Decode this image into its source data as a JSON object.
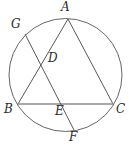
{
  "figure": {
    "width": 129,
    "height": 146,
    "background": "#ffffff",
    "stroke_color": "#595959",
    "chord_bc_color": "#8c8c8c",
    "stroke_width": 1
  },
  "circle": {
    "center_x": 65.5,
    "center_y": 75,
    "radius": 56.5
  },
  "points": {
    "A": {
      "label": "A",
      "x": 68,
      "y": 19,
      "label_x": 61,
      "label_y": 1
    },
    "B": {
      "label": "B",
      "x": 18,
      "y": 104,
      "label_x": 4,
      "label_y": 103
    },
    "C": {
      "label": "C",
      "x": 113,
      "y": 104,
      "label_x": 116,
      "label_y": 103
    },
    "D": {
      "label": "D",
      "x": 47,
      "y": 56,
      "label_x": 48,
      "label_y": 52
    },
    "E": {
      "label": "E",
      "x": 62,
      "y": 104,
      "label_x": 55,
      "label_y": 105
    },
    "F": {
      "label": "F",
      "x": 74,
      "y": 130,
      "label_x": 69,
      "label_y": 131
    },
    "G": {
      "label": "G",
      "x": 25,
      "y": 34,
      "label_x": 11,
      "label_y": 18
    }
  },
  "segments": [
    {
      "name": "segment-AB",
      "from": "A",
      "to": "B"
    },
    {
      "name": "segment-AC",
      "from": "A",
      "to": "C"
    },
    {
      "name": "segment-BC",
      "from": "B",
      "to": "C"
    },
    {
      "name": "segment-GF",
      "from": "G",
      "to": "F"
    }
  ],
  "labels": {
    "A": "A",
    "B": "B",
    "C": "C",
    "D": "D",
    "E": "E",
    "F": "F",
    "G": "G"
  }
}
